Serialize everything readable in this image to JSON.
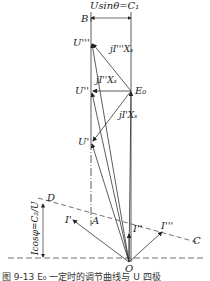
{
  "diagram": {
    "title_top": "Usinθ=C₁",
    "left_dimension_label": "Icosφ=C₂/U",
    "caption": "图 9-13  E₀ 一定时的调节曲线与 U 四极",
    "points": {
      "B": "B",
      "U3": "U'''",
      "U2": "U''",
      "U1": "U'",
      "E0": "E₀",
      "D": "D",
      "A": "A",
      "I1": "I'",
      "I2": "I''",
      "I3": "I'''",
      "C": "C",
      "O": "O"
    },
    "vector_labels": {
      "jI3Xs": "jI'''Xₛ",
      "jI2Xs": "jI''Xₛ",
      "jI1Xs": "jI'Xₛ"
    },
    "colors": {
      "line": "#333333",
      "text": "#222222",
      "background": "#ffffff"
    }
  }
}
